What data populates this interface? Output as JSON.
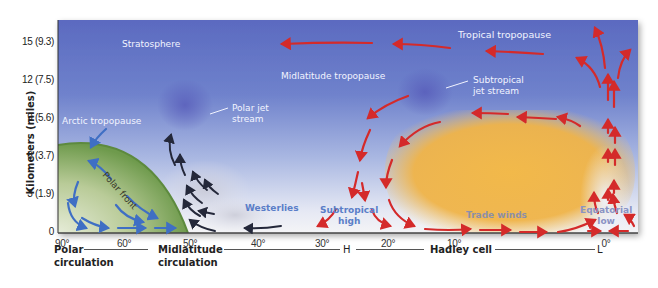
{
  "y_axis": {
    "title": "Kilometers (miles)",
    "ticks": [
      {
        "km": 15,
        "label": "15 (9.3)"
      },
      {
        "km": 12,
        "label": "12 (7.5)"
      },
      {
        "km": 9,
        "label": "9 (5.6)"
      },
      {
        "km": 6,
        "label": "6 (3.7)"
      },
      {
        "km": 3,
        "label": "3 (1.9)"
      },
      {
        "km": 0,
        "label": "0"
      }
    ]
  },
  "x_axis": {
    "ticks": [
      {
        "lat": 90,
        "label": "90°"
      },
      {
        "lat": 60,
        "label": "60°"
      },
      {
        "lat": 50,
        "label": "50°"
      },
      {
        "lat": 40,
        "label": "40°"
      },
      {
        "lat": 30,
        "label": "30°"
      },
      {
        "lat": 20,
        "label": "20°"
      },
      {
        "lat": 10,
        "label": "10°"
      },
      {
        "lat": 0,
        "label": "0°"
      }
    ]
  },
  "bottom_labels": {
    "polar": [
      "Polar",
      "circulation"
    ],
    "midlatitude": [
      "Midlatitude",
      "circulation"
    ],
    "high": "H",
    "hadley": "Hadley cell",
    "low": "L"
  },
  "annotations": {
    "stratosphere": "Stratosphere",
    "tropical_tropopause": "Tropical tropopause",
    "midlatitude_tropopause": "Midlatitude tropopause",
    "arctic_tropopause": "Arctic tropopause",
    "polar_jet": [
      "Polar jet",
      "stream"
    ],
    "subtropical_jet": [
      "Subtropical",
      "jet stream"
    ],
    "polar_front": "Polar front",
    "westerlies": "Westerlies",
    "subtropical_high": [
      "Subtropical",
      "high"
    ],
    "trade_winds": "Trade winds",
    "equatorial_low": [
      "Equatorial",
      "low"
    ]
  },
  "colors": {
    "sky_top": "#5a6cc0",
    "sky_bottom": "#f3f3f6",
    "polar_dome": "#6f9a4e",
    "hadley_warm": "#f0b03c",
    "arrow_polar": "#3f6fc4",
    "arrow_mid": "#24283a",
    "arrow_hadley": "#d42a2a",
    "label_blue": "#5a7ec8"
  }
}
